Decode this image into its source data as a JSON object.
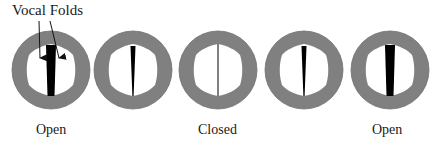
{
  "diagram": {
    "title_label": "Vocal Folds",
    "colors": {
      "ring": "#808080",
      "ring_edge": "#6e6e6e",
      "opening": "#ffffff",
      "fold_gap": "#000000",
      "text": "#1a1a1a"
    },
    "states": [
      {
        "id": "state-1",
        "cx": 51,
        "cy": 70,
        "gap_width": 10,
        "label": "Open"
      },
      {
        "id": "state-2",
        "cx": 133,
        "cy": 70,
        "gap_width": 5,
        "label": ""
      },
      {
        "id": "state-3",
        "cx": 218,
        "cy": 70,
        "gap_width": 1,
        "label": "Closed"
      },
      {
        "id": "state-4",
        "cx": 304,
        "cy": 70,
        "gap_width": 5,
        "label": ""
      },
      {
        "id": "state-5",
        "cx": 390,
        "cy": 70,
        "gap_width": 10,
        "label": "Open"
      }
    ],
    "labels": {
      "open_left": "Open",
      "closed": "Closed",
      "open_right": "Open"
    }
  }
}
